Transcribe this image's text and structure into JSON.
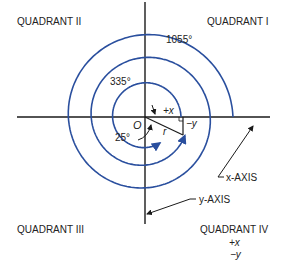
{
  "diagram": {
    "type": "polar-coordinate-spiral",
    "colors": {
      "spiral": "#2a4f9e",
      "axis": "#1a1a1a",
      "text": "#222222"
    },
    "quadrants": {
      "q1": "QUADRANT I",
      "q2": "QUADRANT II",
      "q3": "QUADRANT III",
      "q4": "QUADRANT IV",
      "q4_sign_x": "+x",
      "q4_sign_y": "−y"
    },
    "angles": {
      "a1": "1055°",
      "a2": "335°",
      "a3": "25°"
    },
    "labels": {
      "origin": "O",
      "radius": "r",
      "plus_x": "+x",
      "minus_y": "−y",
      "x_axis": "x-AXIS",
      "y_axis": "y-AXIS"
    }
  }
}
